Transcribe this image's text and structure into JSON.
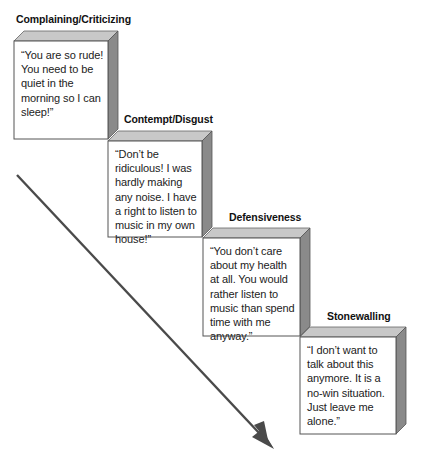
{
  "diagram": {
    "type": "staircase",
    "colors": {
      "face": "#ffffff",
      "top": "#c8c8c8",
      "side": "#8a8a8a",
      "edge": "#555555",
      "arrow": "#4a4a4a"
    },
    "steps": [
      {
        "label": "Complaining/Criticizing",
        "quote": "“You are so rude! You need to be quiet in the morning so I can sleep!”"
      },
      {
        "label": "Contempt/Disgust",
        "quote": "“Don’t be ridiculous! I was hardly making any noise. I have a right to listen to music in my own house!”"
      },
      {
        "label": "Defensiveness",
        "quote": "“You don’t care about my health at all. You would rather listen to music than spend time with me anyway.”"
      },
      {
        "label": "Stonewalling",
        "quote": "“I don’t want to talk about this anymore. It is a no-win situation. Just leave me alone.”"
      }
    ],
    "arrow": {
      "direction": "down-right",
      "icon": "diagonal-arrow-icon"
    }
  }
}
